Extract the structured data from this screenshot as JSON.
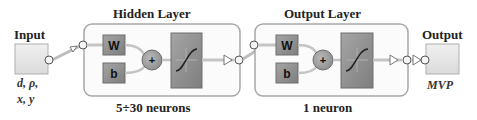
{
  "diagram": {
    "input": {
      "title": "Input",
      "vars_line1": "d, ρ,",
      "vars_line2": "x, y"
    },
    "hidden_layer": {
      "title": "Hidden Layer",
      "weight": "W",
      "bias": "b",
      "sum": "+",
      "caption": "5÷30 neurons",
      "transfer": "sigmoid"
    },
    "output_layer": {
      "title": "Output Layer",
      "weight": "W",
      "bias": "b",
      "sum": "+",
      "caption": "1 neuron",
      "transfer": "linear-sigmoid"
    },
    "output": {
      "title": "Output",
      "var": "MVP"
    },
    "colors": {
      "box_fill": "#e6e6e6",
      "box_border": "#9a9a9a",
      "block_fill": "#8f8f8f",
      "layer_border": "#a8a8a8",
      "io_fill": "#e8e8e8"
    }
  }
}
